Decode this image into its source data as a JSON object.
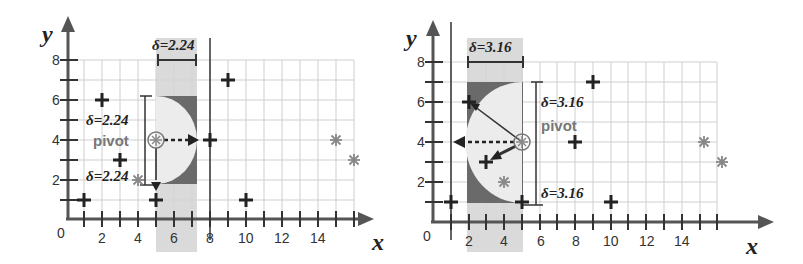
{
  "panels": [
    {
      "id": "left",
      "delta_top_label": "δ=2.24",
      "delta_side_top_label": "δ=2.24",
      "delta_side_bottom_label": "δ=2.24",
      "pivot_label": "pivot",
      "x_axis_label": "x",
      "y_axis_label": "y",
      "origin_label": "0",
      "x_ticks": [
        "2",
        "4",
        "6",
        "8",
        "10",
        "12",
        "14"
      ],
      "y_ticks": [
        "2",
        "4",
        "6",
        "8"
      ],
      "pivot_point": [
        5,
        4
      ],
      "delta": 2.24
    },
    {
      "id": "right",
      "delta_top_label": "δ=3.16",
      "delta_side_top_label": "δ=3.16",
      "delta_side_bottom_label": "δ=3.16",
      "pivot_label": "pivot",
      "x_axis_label": "x",
      "y_axis_label": "y",
      "origin_label": "0",
      "x_ticks": [
        "2",
        "4",
        "6",
        "8",
        "10",
        "12",
        "14"
      ],
      "y_ticks": [
        "2",
        "4",
        "6",
        "8"
      ],
      "pivot_point": [
        5,
        4
      ],
      "delta": 3.16
    }
  ],
  "points": {
    "plus": [
      [
        1,
        1
      ],
      [
        2,
        6
      ],
      [
        3,
        3
      ],
      [
        5,
        1
      ],
      [
        8,
        4
      ],
      [
        9,
        7
      ],
      [
        10,
        1
      ]
    ],
    "star": [
      [
        4,
        2
      ],
      [
        15,
        4
      ],
      [
        16,
        3
      ]
    ]
  },
  "colors": {
    "strip": "#d4d4d4",
    "dark_region": "#6a6a6a",
    "half_disc": "#ececec",
    "grid": "#c8c8c8",
    "axis": "#555555",
    "star": "#888888",
    "marker": "#222222"
  }
}
